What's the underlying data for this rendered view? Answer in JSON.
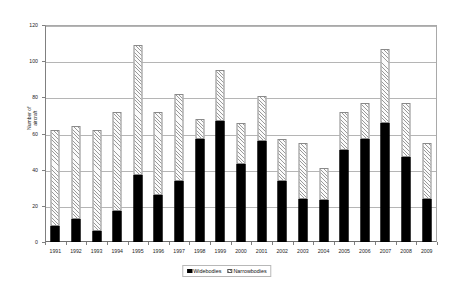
{
  "chart_data": {
    "type": "bar",
    "subtype": "stacked-column",
    "title": "",
    "xlabel": "",
    "ylabel": "Number of aircraft",
    "ylim": [
      0,
      120
    ],
    "yticks": [
      0,
      20,
      40,
      60,
      80,
      100,
      120
    ],
    "grid": true,
    "legend_position": "bottom",
    "categories": [
      "1991",
      "1992",
      "1993",
      "1994",
      "1995",
      "1996",
      "1997",
      "1998",
      "1999",
      "2000",
      "2001",
      "2002",
      "2003",
      "2004",
      "2005",
      "2006",
      "2007",
      "2008",
      "2009"
    ],
    "series": [
      {
        "name": "Widebodies",
        "color": "#000000",
        "values": [
          9,
          13,
          6,
          17,
          37,
          26,
          34,
          57,
          67,
          43,
          56,
          34,
          24,
          23,
          51,
          57,
          66,
          47,
          24
        ]
      },
      {
        "name": "Narrowbodies",
        "color": "#ffffff",
        "values": [
          53,
          51,
          56,
          55,
          72,
          46,
          48,
          11,
          28,
          23,
          25,
          23,
          31,
          18,
          21,
          20,
          41,
          30,
          31
        ]
      }
    ],
    "totals": [
      62,
      64,
      62,
      72,
      109,
      72,
      62,
      68,
      95,
      66,
      81,
      57,
      55,
      41,
      72,
      77,
      107,
      77,
      55
    ]
  },
  "yaxis": {
    "title": "Number of aircraft",
    "title_line1": "Number of",
    "title_line2": "aircraft",
    "ticks": [
      "0",
      "20",
      "40",
      "60",
      "80",
      "100",
      "120"
    ]
  },
  "xaxis": {
    "labels": [
      "1991",
      "1992",
      "1993",
      "1994",
      "1995",
      "1996",
      "1997",
      "1998",
      "1999",
      "2000",
      "2001",
      "2002",
      "2003",
      "2004",
      "2005",
      "2006",
      "2007",
      "2008",
      "2009"
    ]
  },
  "legend": {
    "entries": [
      {
        "label": "Widebodies",
        "pattern": "solid-black"
      },
      {
        "label": "Narrowbodies",
        "pattern": "diagonal-hatch"
      }
    ]
  }
}
